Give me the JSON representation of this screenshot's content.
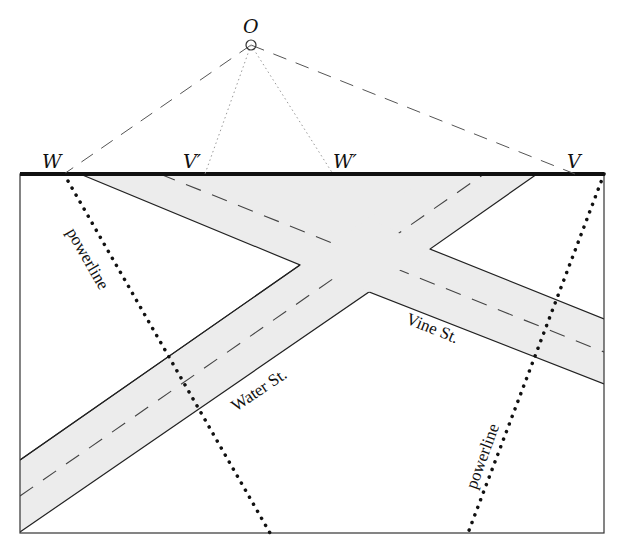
{
  "diagram": {
    "type": "perspective-road-map",
    "colors": {
      "road_fill": "#ececec",
      "ink": "#222222",
      "frame_top": "#111111",
      "sightline": "#555555",
      "projection": "#999999"
    },
    "points": {
      "observer": {
        "label": "O",
        "x": 251,
        "y": 45
      },
      "W": {
        "label": "W",
        "x": 64,
        "y": 174
      },
      "V_prime": {
        "label": "V′",
        "x": 205,
        "y": 174
      },
      "W_prime": {
        "label": "W′",
        "x": 333,
        "y": 174
      },
      "V": {
        "label": "V",
        "x": 575,
        "y": 174
      }
    },
    "streets": [
      {
        "name": "Water St.",
        "label_angle": -34
      },
      {
        "name": "Vine St.",
        "label_angle": 22
      }
    ],
    "powerlines": [
      {
        "label": "powerline",
        "from": [
          64,
          174
        ],
        "to": [
          270,
          533
        ]
      },
      {
        "label": "powerline",
        "from": [
          604,
          174
        ],
        "to": [
          468,
          533
        ]
      }
    ]
  }
}
